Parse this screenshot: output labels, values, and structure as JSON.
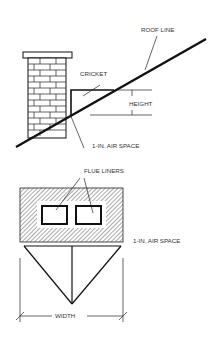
{
  "diagram": {
    "colors": {
      "line": "#111111",
      "text": "#333333",
      "background": "#ffffff"
    },
    "side_view": {
      "labels": {
        "roof_line": "ROOF LINE",
        "cricket": "CRICKET",
        "height": "HEIGHT",
        "air_space": "1-IN. AIR SPACE"
      }
    },
    "plan_view": {
      "labels": {
        "flue_liners": "FLUE LINERS",
        "air_space": "1-IN. AIR SPACE",
        "width": "WIDTH"
      }
    }
  }
}
